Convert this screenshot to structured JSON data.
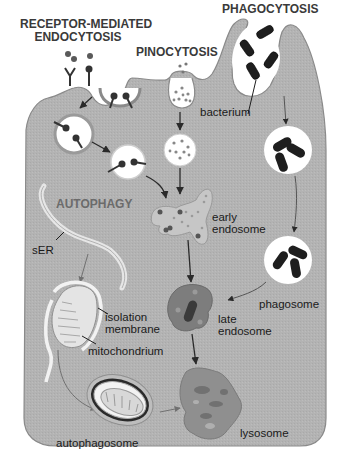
{
  "diagram": {
    "type": "cell-biology-pathways",
    "colors": {
      "cytoplasm": "#b3b3b3",
      "cell_outline": "#8a8a8a",
      "vesicle_fill": "#ffffff",
      "bacterium": "#1e1e1e",
      "early_endosome": "#c4c4c4",
      "late_endosome": "#7d7d7d",
      "lysosome": "#8c8c8c",
      "arrow": "#2a2a2a",
      "autophagy_label": "#6b6b6b"
    },
    "headers": {
      "receptor_mediated": "RECEPTOR-MEDIATED\nENDOCYTOSIS",
      "receptor_mediated_line1": "RECEPTOR-MEDIATED",
      "receptor_mediated_line2": "ENDOCYTOSIS",
      "pinocytosis": "PINOCYTOSIS",
      "phagocytosis": "PHAGOCYTOSIS",
      "autophagy": "AUTOPHAGY"
    },
    "labels": {
      "bacterium": "bacterium",
      "early_endosome_line1": "early",
      "early_endosome_line2": "endosome",
      "sER": "sER",
      "isolation_membrane_line1": "isolation",
      "isolation_membrane_line2": "membrane",
      "mitochondrium": "mitochondrium",
      "phagosome": "phagosome",
      "late_endosome_line1": "late",
      "late_endosome_line2": "endosome",
      "autophagosome": "autophagosome",
      "lysosome": "lysosome"
    },
    "pathways": [
      {
        "name": "receptor-mediated endocytosis",
        "steps": [
          "receptor binding",
          "coated pit",
          "vesicle",
          "vesicle",
          "early endosome"
        ]
      },
      {
        "name": "pinocytosis",
        "steps": [
          "invagination",
          "vesicle",
          "early endosome"
        ]
      },
      {
        "name": "phagocytosis",
        "steps": [
          "bacterium engulfment",
          "vesicle",
          "phagosome",
          "late endosome"
        ]
      },
      {
        "name": "autophagy",
        "steps": [
          "sER",
          "isolation membrane",
          "autophagosome",
          "lysosome"
        ]
      },
      {
        "name": "endosomal maturation",
        "steps": [
          "early endosome",
          "late endosome",
          "lysosome"
        ]
      }
    ]
  }
}
